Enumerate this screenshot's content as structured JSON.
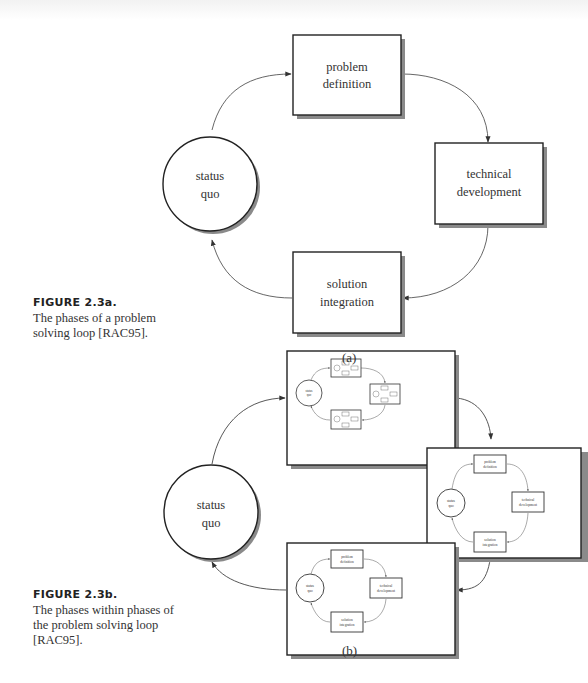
{
  "figure_a": {
    "caption_label": "FIGURE 2.3a.",
    "caption_text": "The phases of a problem solving loop [RAC95].",
    "sublabel": "(a)",
    "nodes": {
      "status_quo": [
        "status",
        "quo"
      ],
      "problem_definition": [
        "problem",
        "definition"
      ],
      "technical_development": [
        "technical",
        "development"
      ],
      "solution_integration": [
        "solution",
        "integration"
      ]
    }
  },
  "figure_b": {
    "caption_label": "FIGURE 2.3b.",
    "caption_text": "The phases within phases of the problem solving loop [RAC95].",
    "sublabel": "(b)",
    "nodes": {
      "status_quo": [
        "status",
        "quo"
      ]
    },
    "nested_nodes": {
      "status_quo": [
        "status",
        "quo"
      ],
      "problem_definition": [
        "problem",
        "definition"
      ],
      "technical_development": [
        "technical",
        "development"
      ],
      "solution_integration": [
        "solution",
        "integration"
      ]
    }
  },
  "colors": {
    "stroke": "#222222",
    "shadow": "#8a8a8a",
    "arrow": "#555555",
    "background": "#ffffff"
  }
}
